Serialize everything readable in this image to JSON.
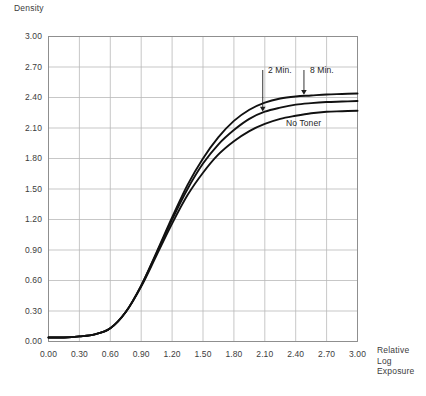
{
  "chart_data": {
    "type": "line",
    "title": "",
    "ylabel": "Density",
    "xlabel": "Relative\nLog\nExposure",
    "xlim": [
      0.0,
      3.0
    ],
    "ylim": [
      0.0,
      3.0
    ],
    "grid": true,
    "legend_position": "inline-annotations",
    "xticks": [
      "0.00",
      "0.30",
      "0.60",
      "0.90",
      "1.20",
      "1.50",
      "1.80",
      "2.10",
      "2.40",
      "2.70",
      "3.00"
    ],
    "yticks": [
      "0.00",
      "0.30",
      "0.60",
      "0.90",
      "1.20",
      "1.50",
      "1.80",
      "2.10",
      "2.40",
      "2.70",
      "3.00"
    ],
    "x": [
      0.0,
      0.15,
      0.3,
      0.45,
      0.6,
      0.75,
      0.9,
      1.05,
      1.2,
      1.35,
      1.5,
      1.65,
      1.8,
      1.95,
      2.1,
      2.25,
      2.4,
      2.55,
      2.7,
      2.85,
      3.0
    ],
    "series": [
      {
        "name": "8 Min.",
        "color": "#111111",
        "values": [
          0.04,
          0.04,
          0.05,
          0.07,
          0.13,
          0.29,
          0.55,
          0.88,
          1.22,
          1.54,
          1.8,
          2.01,
          2.17,
          2.28,
          2.35,
          2.39,
          2.41,
          2.42,
          2.43,
          2.435,
          2.44
        ]
      },
      {
        "name": "2 Min.",
        "color": "#111111",
        "values": [
          0.04,
          0.04,
          0.05,
          0.07,
          0.13,
          0.29,
          0.55,
          0.87,
          1.2,
          1.5,
          1.75,
          1.94,
          2.08,
          2.19,
          2.26,
          2.3,
          2.33,
          2.345,
          2.355,
          2.36,
          2.365
        ]
      },
      {
        "name": "No Toner",
        "color": "#111111",
        "values": [
          0.04,
          0.04,
          0.05,
          0.07,
          0.13,
          0.29,
          0.54,
          0.85,
          1.16,
          1.44,
          1.66,
          1.84,
          1.97,
          2.07,
          2.14,
          2.19,
          2.22,
          2.245,
          2.26,
          2.265,
          2.27
        ]
      }
    ],
    "annotations": [
      {
        "label": "2 Min.",
        "target_series": "2 Min.",
        "pointer": "down-arrow"
      },
      {
        "label": "8 Min.",
        "target_series": "8 Min.",
        "pointer": "down-arrow"
      },
      {
        "label": "No Toner",
        "target_series": "No Toner",
        "pointer": "none"
      }
    ]
  },
  "style": {
    "grid_color": "#b9b9b9",
    "axis_color": "#8d8d8d",
    "curve_color": "#111111",
    "text_color": "#3c3c3c"
  }
}
